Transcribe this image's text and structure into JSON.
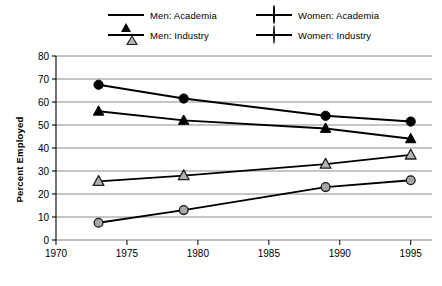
{
  "chart_data": {
    "type": "line",
    "title": "",
    "xlabel": "",
    "ylabel": "Percent Employed",
    "x": [
      1973,
      1979,
      1989,
      1995
    ],
    "xlim": [
      1970,
      1996.5
    ],
    "ylim": [
      0,
      80
    ],
    "xticks": [
      1970,
      1975,
      1980,
      1985,
      1990,
      1995
    ],
    "yticks": [
      0,
      10,
      20,
      30,
      40,
      50,
      60,
      70,
      80
    ],
    "grid": "horizontal",
    "legend_position": "top-center",
    "series": [
      {
        "name": "Men: Academia",
        "marker": "triangle-filled",
        "color": "#000000",
        "values": [
          56,
          52,
          48.5,
          44
        ]
      },
      {
        "name": "Women: Academia",
        "marker": "circle-filled",
        "color": "#000000",
        "values": [
          67.5,
          61.5,
          54,
          51.5
        ]
      },
      {
        "name": "Men: Industry",
        "marker": "triangle-gray",
        "color": "#000000",
        "values": [
          25.5,
          28,
          33,
          37
        ]
      },
      {
        "name": "Women: Industry",
        "marker": "circle-gray",
        "color": "#000000",
        "values": [
          7.5,
          13,
          23,
          26
        ]
      }
    ]
  },
  "legend": {
    "entries": [
      {
        "label": "Men: Academia"
      },
      {
        "label": "Women: Academia"
      },
      {
        "label": "Men: Industry"
      },
      {
        "label": "Women: Industry"
      }
    ]
  },
  "axes": {
    "y_title": "Percent Employed",
    "y_labels": [
      "80",
      "70",
      "60",
      "50",
      "40",
      "30",
      "20",
      "10",
      "0"
    ],
    "x_labels": [
      "1970",
      "1975",
      "1980",
      "1985",
      "1990",
      "1995"
    ]
  },
  "colors": {
    "line": "#000000",
    "grid": "#808080",
    "marker_gray": "#a6a6a6",
    "background": "#ffffff"
  }
}
